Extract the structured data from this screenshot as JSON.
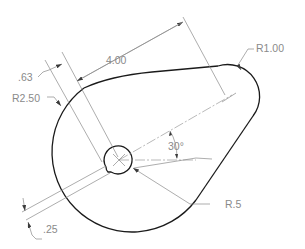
{
  "drawing": {
    "type": "mechanical-part-dimensioned",
    "colors": {
      "outline": "#1a1a1a",
      "dimension": "#8a8a8a",
      "background": "#ffffff"
    },
    "dimensions": {
      "length": "4.00",
      "keyway_offset": ".63",
      "large_radius": "R2.50",
      "small_radius": "R1.00",
      "angle": "30°",
      "hole_radius": "R.5",
      "keyway_width": ".25"
    }
  }
}
